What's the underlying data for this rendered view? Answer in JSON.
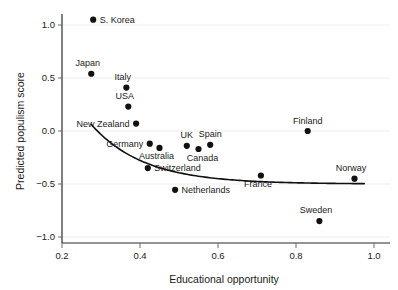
{
  "chart_data": {
    "type": "scatter",
    "title": "",
    "xlabel": "Educational opportunity",
    "ylabel": "Predicted populism score",
    "xlim": [
      0.17,
      0.99
    ],
    "ylim": [
      -1.08,
      1.12
    ],
    "xticks": [
      0.2,
      0.4,
      0.6,
      0.8,
      1.0
    ],
    "xtick_labels": [
      "0.2",
      "0.4",
      "0.6",
      "0.8",
      "1.0"
    ],
    "yticks": [
      1.0,
      0.5,
      0.0,
      -0.5,
      -1.0
    ],
    "ytick_labels": [
      "1.0",
      "0.5",
      "0.0",
      "−0.5",
      "−1.0"
    ],
    "grid": "horizontal-light",
    "legend": "none",
    "marker_color": "#111111",
    "fit_line_color": "#111111",
    "fit_line_label": "fitted trend curve",
    "points": [
      {
        "label": "S. Korea",
        "x": 0.28,
        "y": 1.05,
        "label_pos": "right"
      },
      {
        "label": "Japan",
        "x": 0.275,
        "y": 0.54,
        "label_pos": "above-left"
      },
      {
        "label": "Italy",
        "x": 0.365,
        "y": 0.41,
        "label_pos": "above-left"
      },
      {
        "label": "USA",
        "x": 0.37,
        "y": 0.23,
        "label_pos": "above-left"
      },
      {
        "label": "New Zealand",
        "x": 0.39,
        "y": 0.07,
        "label_pos": "left"
      },
      {
        "label": "Germany",
        "x": 0.425,
        "y": -0.12,
        "label_pos": "left"
      },
      {
        "label": "Australia",
        "x": 0.45,
        "y": -0.16,
        "label_pos": "below-left"
      },
      {
        "label": "Switzerland",
        "x": 0.42,
        "y": -0.35,
        "label_pos": "right"
      },
      {
        "label": "UK",
        "x": 0.52,
        "y": -0.14,
        "label_pos": "above"
      },
      {
        "label": "Canada",
        "x": 0.55,
        "y": -0.17,
        "label_pos": "below-right"
      },
      {
        "label": "Spain",
        "x": 0.58,
        "y": -0.13,
        "label_pos": "above"
      },
      {
        "label": "Netherlands",
        "x": 0.49,
        "y": -0.555,
        "label_pos": "right"
      },
      {
        "label": "France",
        "x": 0.71,
        "y": -0.42,
        "label_pos": "below-left"
      },
      {
        "label": "Finland",
        "x": 0.83,
        "y": 0.0,
        "label_pos": "above"
      },
      {
        "label": "Sweden",
        "x": 0.86,
        "y": -0.85,
        "label_pos": "above-left"
      },
      {
        "label": "Norway",
        "x": 0.95,
        "y": -0.45,
        "label_pos": "above-left"
      }
    ]
  }
}
